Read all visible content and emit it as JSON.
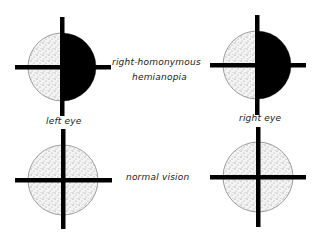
{
  "diagram": {
    "labels": {
      "condition_top": "right-homonymous",
      "condition_top_line2": "hemianopia",
      "condition_bottom": "normal vision",
      "left_eye": "left eye",
      "right_eye": "right eye"
    },
    "colors": {
      "blind_field": "#000000",
      "seeing_field": "#e8e8e8",
      "stipple": "#8a8a8a",
      "crosshair": "#000000"
    },
    "panels": [
      {
        "row": "top",
        "eye": "left",
        "state": "right half blind"
      },
      {
        "row": "top",
        "eye": "right",
        "state": "right half blind"
      },
      {
        "row": "bottom",
        "eye": "left",
        "state": "full field"
      },
      {
        "row": "bottom",
        "eye": "right",
        "state": "full field"
      }
    ]
  }
}
